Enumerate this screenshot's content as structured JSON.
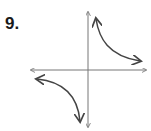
{
  "problem": {
    "number": "9."
  },
  "graph": {
    "type": "hyperbola",
    "equation_form": "y = k/x, k > 0",
    "axes": {
      "x_axis": "horizontal with arrows both ends",
      "y_axis": "vertical with arrows both ends"
    },
    "branches": [
      "quadrant I",
      "quadrant III"
    ],
    "colors": {
      "axes": "#777777",
      "curve": "#444444"
    }
  }
}
